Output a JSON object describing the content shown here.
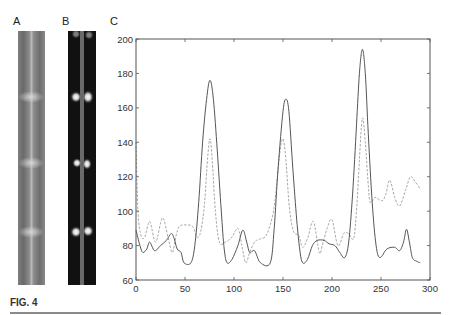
{
  "figure": {
    "caption": "FIG. 4",
    "panels": [
      {
        "label": "A",
        "kind": "grayscale micrograph strip",
        "bright_bands_y": [
          97,
          163,
          232
        ]
      },
      {
        "label": "B",
        "kind": "dark-field fluorescence strip",
        "bright_spots_y": [
          97,
          163,
          232
        ]
      },
      {
        "label": "C",
        "kind": "intensity profile plot"
      }
    ],
    "colors": {
      "axis": "#555555",
      "solid_series": "#555555",
      "dashed_series": "#a8a8a8",
      "panel_a_bg": "#8a8a8a",
      "panel_b_bg": "#111111"
    }
  },
  "chart_data": {
    "type": "line",
    "title": "",
    "xlabel": "",
    "ylabel": "",
    "xlim": [
      0,
      300
    ],
    "ylim": [
      60,
      200
    ],
    "xticks": [
      0,
      50,
      100,
      150,
      200,
      250,
      300
    ],
    "yticks": [
      60,
      80,
      100,
      120,
      140,
      160,
      180,
      200
    ],
    "grid": false,
    "legend": null,
    "series": [
      {
        "name": "solid",
        "style": "solid",
        "x": [
          0,
          4,
          7,
          11,
          14,
          19,
          25,
          31,
          36,
          39,
          42,
          46,
          49,
          56,
          60,
          64,
          68,
          72,
          75.5,
          79,
          83,
          87,
          90,
          93,
          98,
          104,
          109,
          113,
          116,
          121,
          127,
          137,
          141,
          145,
          150,
          153,
          156,
          160,
          164,
          167,
          170,
          175,
          180,
          185,
          192,
          197,
          203,
          208,
          213,
          217,
          221,
          225,
          228,
          231,
          234,
          237,
          241,
          245,
          249,
          256,
          264,
          269,
          273,
          276,
          279,
          282,
          286,
          290
        ],
        "y": [
          89,
          80,
          76,
          78,
          82,
          77,
          80,
          83,
          87,
          84,
          78,
          76,
          70,
          70,
          80,
          105,
          140,
          165,
          176,
          165,
          135,
          100,
          78,
          70,
          72,
          80,
          89,
          82,
          76,
          77,
          70,
          70,
          90,
          125,
          158,
          165,
          158,
          125,
          95,
          78,
          70,
          72,
          80,
          83,
          83,
          81,
          80,
          76,
          73,
          82,
          110,
          150,
          180,
          194,
          180,
          145,
          105,
          80,
          73,
          78,
          79,
          77,
          82,
          89.5,
          82,
          73,
          71,
          70
        ]
      },
      {
        "name": "dashed",
        "style": "dashed",
        "x": [
          0,
          2,
          5,
          9,
          14,
          20,
          27,
          33,
          37,
          41,
          44,
          50,
          58,
          62,
          66,
          70,
          73,
          75.5,
          78,
          81,
          85,
          91,
          98,
          104,
          108,
          112,
          116,
          121,
          127,
          133,
          140,
          144,
          147,
          150,
          153,
          156,
          159,
          162,
          166,
          170,
          175,
          181,
          187,
          190,
          195,
          200,
          206,
          212,
          217,
          222,
          225,
          228,
          231,
          234,
          237,
          239,
          244,
          251,
          255,
          259,
          264,
          269,
          275,
          280,
          285,
          290
        ],
        "y": [
          140,
          100,
          86,
          85,
          94,
          82,
          96,
          84,
          76,
          86,
          91,
          92,
          91,
          85,
          88,
          105,
          130,
          142,
          128,
          100,
          82,
          82,
          85,
          90,
          80,
          70,
          76,
          82,
          84,
          86,
          99,
          118,
          135,
          142,
          130,
          105,
          92,
          87,
          86,
          79,
          84,
          94,
          76,
          80,
          90,
          95,
          80,
          87,
          87,
          84,
          100,
          130,
          154,
          140,
          115,
          105,
          108,
          106,
          110,
          118,
          108,
          103,
          112,
          120,
          117,
          113
        ]
      }
    ]
  }
}
